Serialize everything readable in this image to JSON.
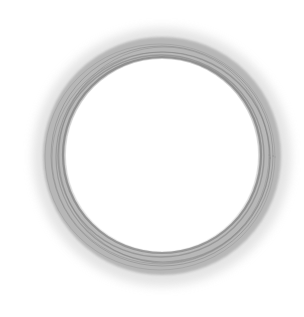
{
  "image": {
    "subject": "pencil-sketched ring",
    "background_color": "#ffffff",
    "ring": {
      "center": [
        162,
        156
      ],
      "inner_radius": 97,
      "outer_radius": 119,
      "stroke_color": "#8a8a8a",
      "halo_color": "#c8c8c8"
    }
  }
}
